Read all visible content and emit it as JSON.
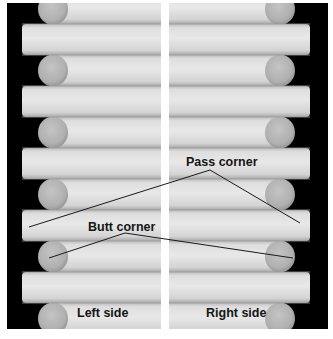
{
  "figure": {
    "panels": [
      {
        "id": "left",
        "label": "Left side"
      },
      {
        "id": "right",
        "label": "Right side"
      }
    ],
    "annotations": [
      {
        "id": "pass-corner",
        "label": "Pass corner"
      },
      {
        "id": "butt-corner",
        "label": "Butt corner"
      }
    ],
    "colors": {
      "background": "#000000",
      "log_light": "#e2e2e2",
      "log_mid": "#cfcfcf",
      "log_shadow": "#a9a9a9",
      "log_end": "#b4b4b4",
      "divider": "#ffffff",
      "leader_line": "#1a1a1a"
    }
  }
}
